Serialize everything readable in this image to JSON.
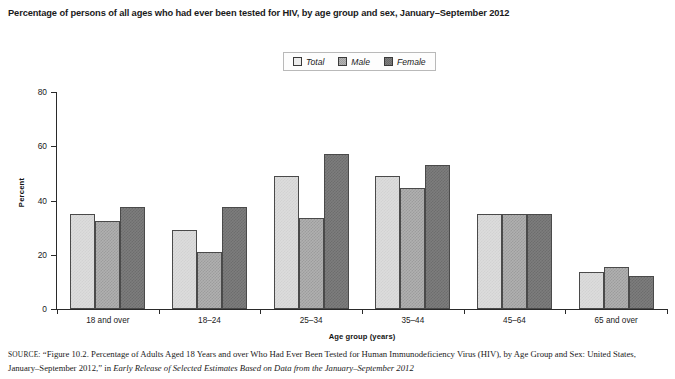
{
  "chart_title": "Percentage of persons of all ages who had ever been tested for HIV, by age group and sex, January–September 2012",
  "legend": {
    "items": [
      {
        "label": "Total",
        "swatch": "light-gray-swatch",
        "color": "#dcdcdc"
      },
      {
        "label": "Male",
        "swatch": "medium-gray-swatch",
        "color": "#b0b0b0"
      },
      {
        "label": "Female",
        "swatch": "dark-gray-swatch",
        "color": "#7d7d7d"
      }
    ]
  },
  "axes": {
    "y_title": "Percent",
    "x_title": "Age group (years)",
    "y_ticks": [
      "0",
      "20",
      "40",
      "60",
      "80"
    ]
  },
  "source_note": {
    "label": "SOURCE:",
    "part1": " “Figure 10.2. Percentage of Adults Aged 18 Years and over Who Had Ever Been Tested for Human Immunodeficiency Virus (HIV), by Age Group and Sex: United States, January–September 2012,” in ",
    "italic": "Early Release of Selected Estimates Based on Data from the January–September 2012"
  },
  "chart_data": {
    "type": "bar",
    "title": "Percentage of persons of all ages who had ever been tested for HIV, by age group and sex, January–September 2012",
    "xlabel": "Age group (years)",
    "ylabel": "Percent",
    "ylim": [
      0,
      80
    ],
    "yticks": [
      0,
      20,
      40,
      60,
      80
    ],
    "grid": false,
    "legend_position": "top-center",
    "categories": [
      "18 and over",
      "18–24",
      "25–34",
      "35–44",
      "45–64",
      "65 and over"
    ],
    "series": [
      {
        "name": "Total",
        "color": "#dcdcdc",
        "values": [
          35.0,
          29.0,
          49.0,
          49.0,
          35.0,
          13.5
        ]
      },
      {
        "name": "Male",
        "color": "#b0b0b0",
        "values": [
          32.5,
          21.0,
          33.5,
          44.5,
          35.0,
          15.5
        ]
      },
      {
        "name": "Female",
        "color": "#7d7d7d",
        "values": [
          37.5,
          37.5,
          57.0,
          53.0,
          35.0,
          12.0
        ]
      }
    ]
  }
}
